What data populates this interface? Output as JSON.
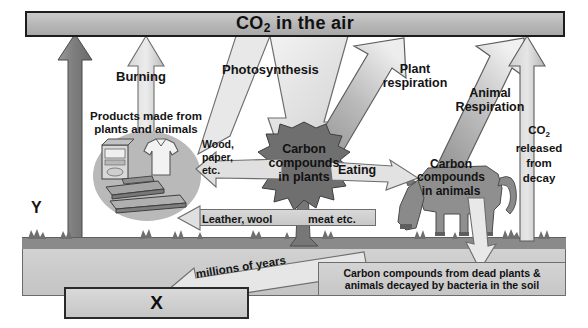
{
  "diagram": {
    "banner": {
      "label_prefix": "CO",
      "label_sub": "2",
      "label_suffix": " in the air"
    },
    "labels": {
      "burning": "Burning",
      "products": "Products made from\nplants and animals",
      "products_line1": "Products made from",
      "products_line2": "plants and animals",
      "photosynthesis": "Photosynthesis",
      "wood_paper_l1": "Wood,",
      "wood_paper_l2": "paper,",
      "wood_paper_l3": "etc.",
      "carbon_plants_l1": "Carbon",
      "carbon_plants_l2": "compounds",
      "carbon_plants_l3": "in plants",
      "plant_resp_l1": "Plant",
      "plant_resp_l2": "respiration",
      "animal_resp_l1": "Animal",
      "animal_resp_l2": "Respiration",
      "co2_decay_l1": "CO",
      "co2_decay_sub": "2",
      "co2_decay_l2": "released",
      "co2_decay_l3": "from",
      "co2_decay_l4": "decay",
      "eating": "Eating",
      "carbon_animals_l1": "Carbon",
      "carbon_animals_l2": "compounds",
      "carbon_animals_l3": "in animals",
      "leather_wool": "Leather, wool",
      "meat_etc": "meat etc.",
      "millions_years": "millions of years",
      "soil_text_l1": "Carbon compounds from dead plants &",
      "soil_text_l2": "animals decayed by bacteria in the soil",
      "marker_x": "X",
      "marker_y": "Y"
    },
    "colors": {
      "banner_fill": "#b6b6b6",
      "banner_border": "#1c1c1c",
      "arrow_light": "#e3e3e3",
      "arrow_mid": "#b4b4b4",
      "arrow_dark": "#8d8d8d",
      "soil_dark": "#8a8a8a",
      "soil_light": "#c8c8c8",
      "tree_fill": "#6f6f6f",
      "animal_fill": "#8f8f8f",
      "text": "#141414",
      "background": "#ffffff"
    },
    "icons": {
      "tree": "tree-icon",
      "cow": "cow-icon",
      "carton": "carton-icon",
      "shirt": "shirt-icon",
      "planks": "planks-icon",
      "grass": "grass-icon"
    }
  }
}
